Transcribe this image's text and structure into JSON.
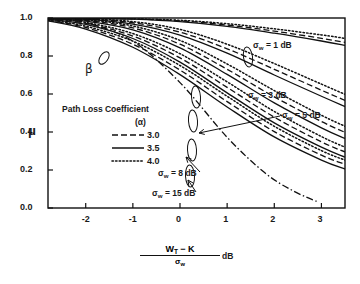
{
  "chart_data": {
    "type": "line",
    "title": "",
    "xlabel": "(W_T - K)/sigma_w dB",
    "xlabel_parts": {
      "numerator": "W",
      "numerator_sub": "T",
      "numerator_rest": "− K",
      "denominator": "σ",
      "denominator_sub": "w",
      "unit": "dB"
    },
    "ylabel": "μ",
    "xlim": [
      -2.8,
      3.5
    ],
    "ylim": [
      0.0,
      1.0
    ],
    "xticks": [
      "-2",
      "-1",
      "0",
      "1",
      "2",
      "3"
    ],
    "xtick_values": [
      -2,
      -1,
      0,
      1,
      2,
      3
    ],
    "yticks": [
      "0.0",
      "0.2",
      "0.4",
      "0.6",
      "0.8",
      "1.0"
    ],
    "ytick_values": [
      0.0,
      0.2,
      0.4,
      0.6,
      0.8,
      1.0
    ],
    "grid": false,
    "legend_position": "left-middle",
    "legend": {
      "title": "Path Loss Coefficient",
      "symbol": "(α)",
      "entries": [
        {
          "label": "3.0",
          "style": "dashed"
        },
        {
          "label": "3.5",
          "style": "solid"
        },
        {
          "label": "4.0",
          "style": "dotted"
        }
      ]
    },
    "annotations": [
      {
        "text": "σ",
        "sub": "w",
        "rest": "= 1 dB",
        "label": "sigma-w-1db"
      },
      {
        "text": "σ",
        "sub": "w",
        "rest": "= 3 dB",
        "label": "sigma-w-3db"
      },
      {
        "text": "σ",
        "sub": "w",
        "rest": "= 5 dB",
        "label": "sigma-w-5db"
      },
      {
        "text": "σ",
        "sub": "w",
        "rest": "= 8 dB",
        "label": "sigma-w-8db"
      },
      {
        "text": "σ",
        "sub": "w",
        "rest": "= 15 dB",
        "label": "sigma-w-15db"
      },
      {
        "text": "β",
        "sub": "",
        "rest": "",
        "label": "beta"
      }
    ],
    "groups": [
      {
        "name": "sigma_w = 1 dB",
        "sigma_w": 1,
        "series": [
          {
            "name": "alpha=3.0",
            "style": "dashed",
            "x": [
              -2.8,
              -2.0,
              -1.0,
              0.0,
              1.0,
              2.0,
              3.0,
              3.5
            ],
            "y": [
              1.0,
              0.999,
              0.995,
              0.985,
              0.963,
              0.931,
              0.893,
              0.872
            ]
          },
          {
            "name": "alpha=3.5",
            "style": "solid",
            "x": [
              -2.8,
              -2.0,
              -1.0,
              0.0,
              1.0,
              2.0,
              3.0,
              3.5
            ],
            "y": [
              1.0,
              0.999,
              0.994,
              0.981,
              0.956,
              0.92,
              0.879,
              0.856
            ]
          },
          {
            "name": "alpha=4.0",
            "style": "dotted",
            "x": [
              -2.8,
              -2.0,
              -1.0,
              0.0,
              1.0,
              2.0,
              3.0,
              3.5
            ],
            "y": [
              1.0,
              0.999,
              0.996,
              0.988,
              0.97,
              0.943,
              0.911,
              0.893
            ]
          }
        ]
      },
      {
        "name": "sigma_w = 3 dB",
        "sigma_w": 3,
        "series": [
          {
            "name": "alpha=3.0",
            "style": "dashed",
            "x": [
              -2.8,
              -2.0,
              -1.0,
              0.0,
              1.0,
              2.0,
              3.0,
              3.5
            ],
            "y": [
              0.999,
              0.995,
              0.975,
              0.925,
              0.838,
              0.73,
              0.62,
              0.566
            ]
          },
          {
            "name": "alpha=3.5",
            "style": "solid",
            "x": [
              -2.8,
              -2.0,
              -1.0,
              0.0,
              1.0,
              2.0,
              3.0,
              3.5
            ],
            "y": [
              0.999,
              0.993,
              0.968,
              0.91,
              0.815,
              0.7,
              0.588,
              0.534
            ]
          },
          {
            "name": "alpha=4.0",
            "style": "dotted",
            "x": [
              -2.8,
              -2.0,
              -1.0,
              0.0,
              1.0,
              2.0,
              3.0,
              3.5
            ],
            "y": [
              0.999,
              0.996,
              0.981,
              0.94,
              0.862,
              0.76,
              0.652,
              0.598
            ]
          }
        ]
      },
      {
        "name": "sigma_w = 5 dB",
        "sigma_w": 5,
        "series": [
          {
            "name": "alpha=3.0",
            "style": "dashed",
            "x": [
              -2.8,
              -2.0,
              -1.0,
              0.0,
              1.0,
              2.0,
              3.0,
              3.5
            ],
            "y": [
              0.998,
              0.988,
              0.948,
              0.862,
              0.73,
              0.585,
              0.455,
              0.398
            ]
          },
          {
            "name": "alpha=3.5",
            "style": "solid",
            "x": [
              -2.8,
              -2.0,
              -1.0,
              0.0,
              1.0,
              2.0,
              3.0,
              3.5
            ],
            "y": [
              0.997,
              0.984,
              0.938,
              0.843,
              0.703,
              0.553,
              0.422,
              0.366
            ]
          },
          {
            "name": "alpha=4.0",
            "style": "dotted",
            "x": [
              -2.8,
              -2.0,
              -1.0,
              0.0,
              1.0,
              2.0,
              3.0,
              3.5
            ],
            "y": [
              0.998,
              0.991,
              0.958,
              0.882,
              0.758,
              0.618,
              0.488,
              0.43
            ]
          }
        ]
      },
      {
        "name": "sigma_w = 8 dB",
        "sigma_w": 8,
        "series": [
          {
            "name": "alpha=3.0",
            "style": "dashed",
            "x": [
              -2.8,
              -2.0,
              -1.0,
              0.0,
              1.0,
              2.0,
              3.0,
              3.5
            ],
            "y": [
              0.995,
              0.972,
              0.905,
              0.79,
              0.635,
              0.478,
              0.348,
              0.295
            ]
          },
          {
            "name": "alpha=3.5",
            "style": "solid",
            "x": [
              -2.8,
              -2.0,
              -1.0,
              0.0,
              1.0,
              2.0,
              3.0,
              3.5
            ],
            "y": [
              0.993,
              0.966,
              0.892,
              0.768,
              0.606,
              0.448,
              0.32,
              0.268
            ]
          },
          {
            "name": "alpha=4.0",
            "style": "dotted",
            "x": [
              -2.8,
              -2.0,
              -1.0,
              0.0,
              1.0,
              2.0,
              3.0,
              3.5
            ],
            "y": [
              0.996,
              0.977,
              0.918,
              0.812,
              0.664,
              0.508,
              0.376,
              0.32
            ]
          }
        ]
      },
      {
        "name": "sigma_w = 15 dB",
        "sigma_w": 15,
        "series": [
          {
            "name": "alpha=3.0",
            "style": "dashed",
            "x": [
              -2.8,
              -2.0,
              -1.0,
              0.0,
              1.0,
              2.0,
              3.0,
              3.5
            ],
            "y": [
              0.988,
              0.95,
              0.862,
              0.726,
              0.56,
              0.402,
              0.278,
              0.23
            ]
          },
          {
            "name": "alpha=3.5",
            "style": "solid",
            "x": [
              -2.8,
              -2.0,
              -1.0,
              0.0,
              1.0,
              2.0,
              3.0,
              3.5
            ],
            "y": [
              0.985,
              0.942,
              0.846,
              0.702,
              0.532,
              0.374,
              0.252,
              0.205
            ]
          },
          {
            "name": "alpha=4.0",
            "style": "dotted",
            "x": [
              -2.8,
              -2.0,
              -1.0,
              0.0,
              1.0,
              2.0,
              3.0,
              3.5
            ],
            "y": [
              0.99,
              0.957,
              0.878,
              0.75,
              0.588,
              0.43,
              0.302,
              0.252
            ]
          }
        ]
      },
      {
        "name": "beta",
        "sigma_w": null,
        "series": [
          {
            "name": "beta",
            "style": "dashdot",
            "x": [
              -2.8,
              -2.0,
              -1.0,
              0.0,
              1.0,
              1.8,
              2.4,
              2.9
            ],
            "y": [
              0.997,
              0.975,
              0.878,
              0.66,
              0.372,
              0.185,
              0.09,
              0.035
            ]
          }
        ]
      }
    ]
  }
}
